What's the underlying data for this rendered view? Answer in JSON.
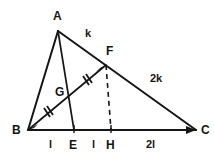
{
  "figure": {
    "type": "geometry-diagram",
    "background_color": "#ffffff",
    "stroke_color": "#161616",
    "vertices": {
      "A": {
        "label": "A",
        "x": 58,
        "y": 30
      },
      "B": {
        "label": "B",
        "x": 28,
        "y": 130
      },
      "C": {
        "label": "C",
        "x": 196,
        "y": 131
      },
      "F": {
        "label": "F",
        "x": 106,
        "y": 64
      },
      "G": {
        "label": "G",
        "x": 66,
        "y": 97
      },
      "E": {
        "label": "E",
        "x": 74,
        "y": 130
      },
      "H": {
        "label": "H",
        "x": 111,
        "y": 130
      }
    },
    "vertex_labels": [
      {
        "name": "vertex-label-a",
        "text": "A",
        "x": 53,
        "y": 10
      },
      {
        "name": "vertex-label-b",
        "text": "B",
        "x": 12,
        "y": 124
      },
      {
        "name": "vertex-label-c",
        "text": "C",
        "x": 201,
        "y": 124
      },
      {
        "name": "vertex-label-f",
        "text": "F",
        "x": 106,
        "y": 45
      },
      {
        "name": "vertex-label-g",
        "text": "G",
        "x": 55,
        "y": 86
      },
      {
        "name": "vertex-label-e",
        "text": "E",
        "x": 69,
        "y": 139
      },
      {
        "name": "vertex-label-h",
        "text": "H",
        "x": 106,
        "y": 139
      }
    ],
    "segment_labels": [
      {
        "name": "segment-label-af",
        "text": "k",
        "x": 85,
        "y": 28,
        "segment": "AF"
      },
      {
        "name": "segment-label-fc",
        "text": "2k",
        "x": 150,
        "y": 73,
        "segment": "FC"
      },
      {
        "name": "segment-label-be",
        "text": "l",
        "x": 49,
        "y": 139,
        "segment": "BE"
      },
      {
        "name": "segment-label-eh",
        "text": "l",
        "x": 92,
        "y": 139,
        "segment": "EH"
      },
      {
        "name": "segment-label-hc",
        "text": "2l",
        "x": 146,
        "y": 139,
        "segment": "HC"
      }
    ],
    "edges": [
      {
        "name": "edge-ab",
        "from": "A",
        "to": "B",
        "style": "solid"
      },
      {
        "name": "edge-ac",
        "from": "A",
        "to": "C",
        "style": "solid"
      },
      {
        "name": "edge-bc",
        "from": "B",
        "to": "C",
        "style": "solid"
      },
      {
        "name": "cevian-ae",
        "from": "A",
        "to": "E",
        "style": "solid"
      },
      {
        "name": "cevian-bf",
        "from": "B",
        "to": "F",
        "style": "solid"
      },
      {
        "name": "altitude-fh",
        "from": "F",
        "to": "H",
        "style": "dashed"
      }
    ],
    "tick_marks": [
      {
        "name": "tick-mark-bg",
        "on_segment": "BG",
        "count": 2
      },
      {
        "name": "tick-mark-gf",
        "on_segment": "GF",
        "count": 2
      }
    ],
    "baseline_ticks": [
      {
        "name": "baseline-tick-e",
        "x": 74
      },
      {
        "name": "baseline-tick-h",
        "x": 111
      }
    ]
  }
}
